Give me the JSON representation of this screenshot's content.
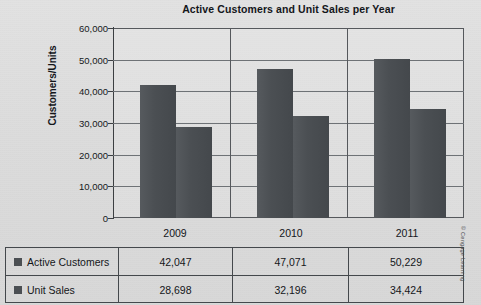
{
  "chart_data": {
    "type": "bar",
    "title": "Active Customers and Unit Sales per Year",
    "xlabel": "",
    "ylabel": "Customers/Units",
    "categories": [
      "2009",
      "2010",
      "2011"
    ],
    "series": [
      {
        "name": "Active Customers",
        "values": [
          42047,
          47071,
          50229
        ],
        "color": "#4b4f53"
      },
      {
        "name": "Unit Sales",
        "values": [
          28698,
          32196,
          34424
        ],
        "color": "#4b4f53"
      }
    ],
    "ylim": [
      0,
      60000
    ],
    "ytick_values": [
      60000,
      50000,
      40000,
      30000,
      20000,
      10000,
      0
    ],
    "ytick_labels": [
      "60,000",
      "50,000",
      "40,000",
      "30,000",
      "20,000",
      "10,000",
      "0"
    ],
    "grid": true,
    "legend_position": "table-row-labels",
    "data_table": {
      "header": [
        "",
        "2009",
        "2010",
        "2011"
      ],
      "rows": [
        {
          "label": "Active Customers",
          "values": [
            "42,047",
            "47,071",
            "50,229"
          ]
        },
        {
          "label": "Unit Sales",
          "values": [
            "28,698",
            "32,196",
            "34,424"
          ]
        }
      ]
    }
  },
  "credit": "© Cengage Learning"
}
